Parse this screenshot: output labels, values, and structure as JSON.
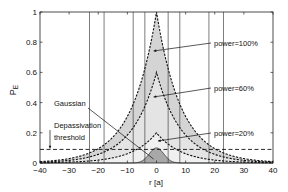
{
  "chart_data": {
    "type": "line",
    "title": "",
    "xlabel": "r [a]",
    "ylabel": "P",
    "ylabel_subscript": "E",
    "xlim": [
      -40,
      40
    ],
    "ylim": [
      0,
      1
    ],
    "xticks": [
      -40,
      -30,
      -20,
      -10,
      0,
      10,
      20,
      30,
      40
    ],
    "yticks": [
      0,
      0.2,
      0.4,
      0.6,
      0.8,
      1
    ],
    "ytick_labels": [
      "0",
      "0.2",
      "0.4",
      "0.6",
      "0.8",
      "1"
    ],
    "grid": false,
    "series": [
      {
        "name": "power=100%",
        "peak": 1.0,
        "decay_length": 8.5,
        "style": "dotted-dashed",
        "fill": "#d4d4d4",
        "threshold_crossing_r": 23
      },
      {
        "name": "power=60%",
        "peak": 0.6,
        "decay_length": 8.5,
        "style": "dotted-dashed",
        "fill": "#e4e4e4",
        "threshold_crossing_r": 18
      },
      {
        "name": "power=20%",
        "peak": 0.2,
        "decay_length": 8.5,
        "style": "dotted-dashed",
        "fill": "#f0f0f0",
        "threshold_crossing_r": 8
      },
      {
        "name": "Gaussian",
        "peak": 0.1,
        "sigma": 2.5,
        "style": "solid",
        "fill": "#a8a8a8"
      }
    ],
    "threshold": {
      "value": 0.09,
      "label": "Depassivation threshold",
      "style": "dashed"
    },
    "vertical_lines_r": [
      -23,
      -18,
      -8,
      -4,
      4,
      8,
      18,
      23
    ],
    "annotations": [
      {
        "text": "power=100%",
        "points_to_series": "power=100%"
      },
      {
        "text": "power=60%",
        "points_to_series": "power=60%"
      },
      {
        "text": "power=20%",
        "points_to_series": "power=20%"
      },
      {
        "text": "Gaussian",
        "points_to_series": "Gaussian"
      },
      {
        "text": "Depassivation",
        "points_to": "threshold"
      },
      {
        "text": "threshold",
        "points_to": "threshold"
      }
    ]
  }
}
